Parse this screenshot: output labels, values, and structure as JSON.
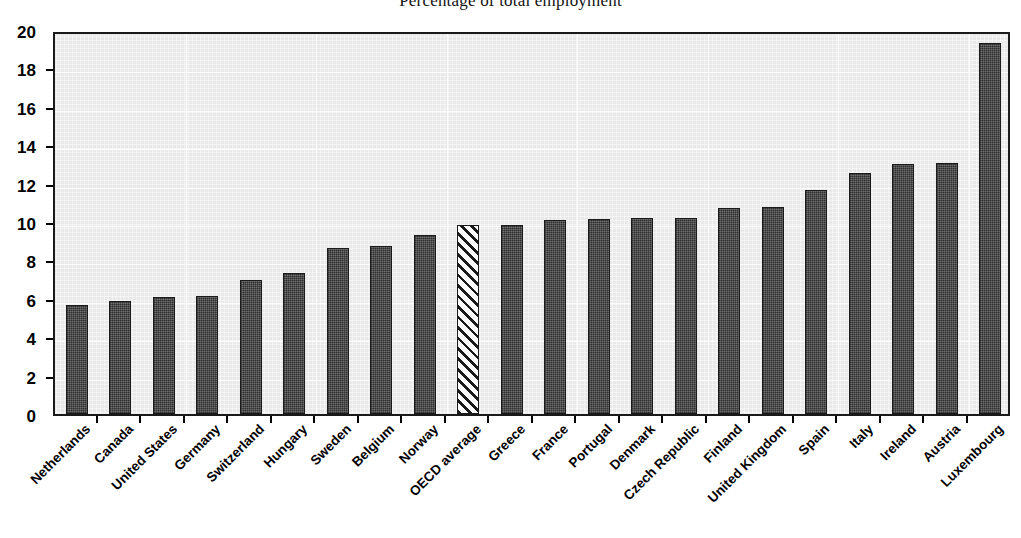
{
  "chart_data": {
    "type": "bar",
    "title": "Percentage of total employment",
    "subtitle": "",
    "xlabel": "",
    "ylabel": "",
    "ylim": [
      0,
      20
    ],
    "ytick_step": 2,
    "grid": true,
    "legend": null,
    "categories": [
      "Netherlands",
      "Canada",
      "United States",
      "Germany",
      "Switzerland",
      "Hungary",
      "Sweden",
      "Belgium",
      "Norway",
      "OECD average",
      "Greece",
      "France",
      "Portugal",
      "Denmark",
      "Czech Republic",
      "Finland",
      "United Kingdom",
      "Spain",
      "Italy",
      "Ireland",
      "Austria",
      "Luxembourg"
    ],
    "values": [
      5.7,
      5.9,
      6.1,
      6.15,
      7.0,
      7.35,
      8.65,
      8.75,
      9.3,
      9.85,
      9.85,
      10.1,
      10.15,
      10.2,
      10.2,
      10.75,
      10.8,
      11.65,
      12.55,
      13.0,
      13.05,
      19.3
    ],
    "highlight_index": 9,
    "highlight_style": "hatched",
    "ytick_labels": [
      "20",
      "18",
      "16",
      "14",
      "12",
      "10",
      "8",
      "6",
      "4",
      "2",
      "0"
    ],
    "colors": {
      "bar_fill": "#4d4d4d",
      "bar_border": "#1a1a1a",
      "highlight_fill": "#fbfbfb",
      "plot_background": "#e9e9e9",
      "gridline": "#ffffff",
      "axis": "#1a1a1a",
      "text": "#000000"
    }
  }
}
